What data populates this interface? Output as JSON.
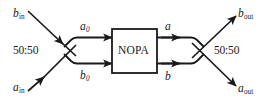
{
  "diagram": {
    "colors": {
      "line": "#1a1a1a",
      "text": "#1a1a1a",
      "background": "#ffffff",
      "box_fill": "#ffffff"
    },
    "component": {
      "label": "NOPA"
    },
    "beamsplitters": [
      {
        "id": "bs-left",
        "label": "50:50"
      },
      {
        "id": "bs-right",
        "label": "50:50"
      }
    ],
    "ports": {
      "input_top": {
        "symbol": "b",
        "subscript": "in",
        "label": "b_in"
      },
      "input_bottom": {
        "symbol": "a",
        "subscript": "in",
        "label": "a_in"
      },
      "internal_top_left": {
        "symbol": "a",
        "subscript": "0",
        "label": "a_0"
      },
      "internal_bottom_left": {
        "symbol": "b",
        "subscript": "0",
        "label": "b_0"
      },
      "internal_top_right": {
        "symbol": "a",
        "subscript": "",
        "label": "a"
      },
      "internal_bottom_right": {
        "symbol": "b",
        "subscript": "",
        "label": "b"
      },
      "output_top": {
        "symbol": "b",
        "subscript": "out",
        "label": "b_out"
      },
      "output_bottom": {
        "symbol": "a",
        "subscript": "out",
        "label": "a_out"
      }
    }
  }
}
